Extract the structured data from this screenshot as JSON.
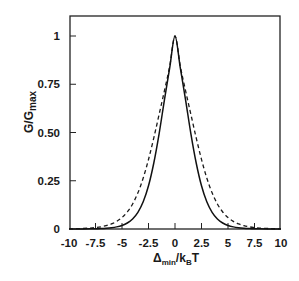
{
  "chart_data": {
    "type": "line",
    "title": "",
    "xlabel": "Δ_min / k_B T",
    "xlabel_main": "Δ",
    "xlabel_sub1": "min",
    "xlabel_mid": "/k",
    "xlabel_sub2": "B",
    "xlabel_end": "T",
    "ylabel": "G/G_max",
    "ylabel_main": "G/G",
    "ylabel_sub": "max",
    "xlim": [
      -10,
      10
    ],
    "ylim": [
      0,
      1.1
    ],
    "xticks": [
      -10,
      -7.5,
      -5,
      -2.5,
      0,
      2.5,
      5,
      7.5,
      10
    ],
    "xtick_labels": [
      "-10",
      "-7.5",
      "-5",
      "-2.5",
      "0",
      "2.5",
      "5",
      "7.5",
      "10"
    ],
    "yticks": [
      0,
      0.25,
      0.5,
      0.75,
      1
    ],
    "ytick_labels": [
      "0",
      "0.25",
      "0.50",
      "0.75",
      "1"
    ],
    "grid": false,
    "legend": null,
    "x": [
      -10,
      -9,
      -8,
      -7.5,
      -7,
      -6.5,
      -6,
      -5.5,
      -5,
      -4.5,
      -4,
      -3.5,
      -3,
      -2.5,
      -2,
      -1.5,
      -1,
      -0.5,
      0,
      0.5,
      1,
      1.5,
      2,
      2.5,
      3,
      3.5,
      4,
      4.5,
      5,
      5.5,
      6,
      6.5,
      7,
      7.5,
      8,
      9,
      10
    ],
    "series": [
      {
        "name": "solid",
        "style": "solid",
        "values": [
          0.0,
          0.0003,
          0.0008,
          0.0013,
          0.0023,
          0.0039,
          0.0065,
          0.011,
          0.0185,
          0.0311,
          0.052,
          0.0862,
          0.1407,
          0.2239,
          0.342,
          0.4933,
          0.6683,
          0.8347,
          1.0,
          0.8347,
          0.6683,
          0.4933,
          0.342,
          0.2239,
          0.1407,
          0.0862,
          0.052,
          0.0311,
          0.0185,
          0.011,
          0.0065,
          0.0039,
          0.0023,
          0.0013,
          0.0008,
          0.0003,
          0.0
        ]
      },
      {
        "name": "dashed",
        "style": "dashed",
        "values": [
          0.0007,
          0.002,
          0.0048,
          0.0074,
          0.0113,
          0.0172,
          0.0261,
          0.0395,
          0.0593,
          0.0882,
          0.1296,
          0.1873,
          0.264,
          0.3603,
          0.4722,
          0.5933,
          0.7155,
          0.8435,
          1.0,
          0.8435,
          0.7155,
          0.5933,
          0.4722,
          0.3603,
          0.264,
          0.1873,
          0.1296,
          0.0882,
          0.0593,
          0.0395,
          0.0261,
          0.0172,
          0.0113,
          0.0074,
          0.0048,
          0.002,
          0.0007
        ]
      }
    ]
  }
}
